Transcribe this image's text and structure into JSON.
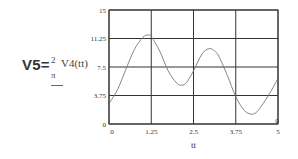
{
  "formula": {
    "lhs": "V5=",
    "numerator": "2",
    "function_call": "V4(tt)",
    "denominator": "π"
  },
  "chart_data": {
    "type": "line",
    "title": "",
    "xlabel": "tt",
    "ylabel": "",
    "xlim": [
      0,
      5
    ],
    "ylim": [
      0,
      15
    ],
    "grid": true,
    "legend": null,
    "x_ticks": [
      "0",
      "1.25",
      "2.5",
      "3.75",
      "5"
    ],
    "y_ticks": [
      "0",
      "3.75",
      "7.5",
      "11.25",
      "15"
    ],
    "x_tick_values": [
      0,
      1.25,
      2.5,
      3.75,
      5
    ],
    "y_tick_values": [
      0,
      3.75,
      7.5,
      11.25,
      15
    ],
    "series": [
      {
        "name": "V5",
        "x": [
          0,
          0.25,
          0.5,
          0.75,
          1.0,
          1.15,
          1.25,
          1.5,
          1.75,
          2.0,
          2.15,
          2.3,
          2.5,
          2.75,
          2.95,
          3.1,
          3.25,
          3.5,
          3.75,
          4.0,
          4.2,
          4.35,
          4.5,
          4.75,
          5.0
        ],
        "values": [
          2.7,
          4.5,
          7.2,
          9.8,
          11.4,
          11.7,
          11.5,
          9.6,
          7.0,
          5.4,
          5.1,
          5.5,
          7.0,
          9.2,
          9.9,
          9.7,
          8.9,
          6.4,
          3.6,
          1.8,
          1.3,
          1.5,
          2.3,
          4.0,
          6.0
        ]
      }
    ],
    "annotations": [
      {
        "text": "0",
        "position": "bottom-right corner marker"
      }
    ]
  }
}
